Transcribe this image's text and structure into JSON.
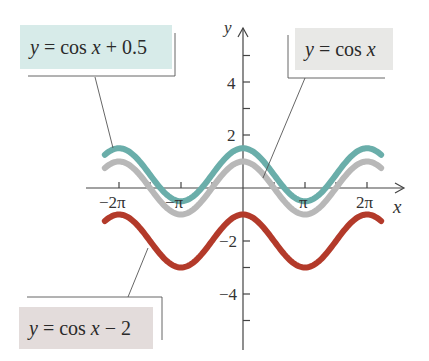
{
  "chart_data": {
    "type": "line",
    "title": "",
    "xlabel": "x",
    "ylabel": "y",
    "xlim": [
      -7.0,
      8.2
    ],
    "ylim": [
      -6.2,
      5.8
    ],
    "x_ticks": [
      -6.2832,
      -4.7124,
      -3.1416,
      -1.5708,
      1.5708,
      3.1416,
      4.7124,
      6.2832
    ],
    "x_tick_labels": [
      {
        "value": -6.2832,
        "label": "−2π"
      },
      {
        "value": -3.1416,
        "label": "−π"
      },
      {
        "value": 3.1416,
        "label": "π"
      },
      {
        "value": 6.2832,
        "label": "2π"
      }
    ],
    "y_ticks": [
      -5,
      -4,
      -3,
      -2,
      -1,
      1,
      2,
      3,
      4,
      5
    ],
    "y_tick_labels": [
      {
        "value": 4,
        "label": "4"
      },
      {
        "value": 2,
        "label": "2"
      },
      {
        "value": -2,
        "label": "−2"
      },
      {
        "value": -4,
        "label": "−4"
      }
    ],
    "grid": false,
    "x_domain": [
      -7.0,
      7.0
    ],
    "series": [
      {
        "name": "y = cos x + 0.5",
        "function": "cos(x)+0.5",
        "shift": 0.5,
        "color": "#6aaeaa",
        "max": 1.5,
        "min": -0.5
      },
      {
        "name": "y = cos x",
        "function": "cos(x)",
        "shift": 0,
        "color": "#b8b8b8",
        "max": 1,
        "min": -1
      },
      {
        "name": "y = cos x − 2",
        "function": "cos(x)-2",
        "shift": -2,
        "color": "#b33a2a",
        "max": -1,
        "min": -3
      }
    ],
    "annotations": [
      {
        "text": "y = cos x + 0.5",
        "position": "top-left",
        "background": "#d7ebe9"
      },
      {
        "text": "y = cos x",
        "position": "top-right",
        "background": "#e8e8e6"
      },
      {
        "text": "y = cos x − 2",
        "position": "bottom-left",
        "background": "#e3dcdb"
      }
    ]
  },
  "labels": {
    "top_left": {
      "y": "y",
      "rest": " = cos ",
      "x": "x",
      "tail": " + 0.5"
    },
    "top_right": {
      "y": "y",
      "rest": " = cos ",
      "x": "x",
      "tail": ""
    },
    "bottom": {
      "y": "y",
      "rest": " = cos ",
      "x": "x",
      "tail": " − 2"
    }
  },
  "axes": {
    "x_name": "x",
    "y_name": "y"
  },
  "ticks": {
    "x": {
      "neg2pi": "−2π",
      "negpi": "−π",
      "pi": "π",
      "twopi": "2π"
    },
    "y": {
      "p4": "4",
      "p2": "2",
      "n2": "−2",
      "n4": "−4"
    }
  }
}
